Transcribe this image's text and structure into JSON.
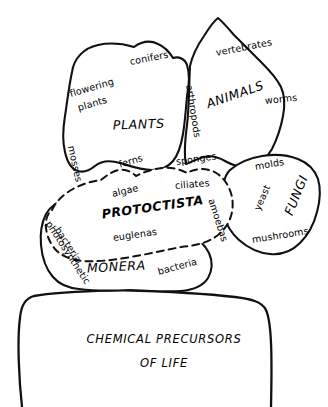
{
  "diagram": {
    "colors": {
      "ink": "#111111",
      "background": "#ffffff"
    },
    "kingdoms": [
      {
        "id": "plants",
        "label": "PLANTS",
        "boundary": "solid",
        "examples": [
          "flowering plants",
          "conifers",
          "mosses",
          "ferns"
        ]
      },
      {
        "id": "animals",
        "label": "ANIMALS",
        "boundary": "solid",
        "examples": [
          "vertebrates",
          "worms",
          "arthropods",
          "sponges"
        ]
      },
      {
        "id": "fungi",
        "label": "FUNGI",
        "boundary": "solid",
        "examples": [
          "molds",
          "yeast",
          "mushrooms"
        ]
      },
      {
        "id": "protoctista",
        "label": "PROTOCTISTA",
        "boundary": "dashed",
        "examples": [
          "algae",
          "ciliates",
          "amoebas",
          "euglenas"
        ]
      },
      {
        "id": "monera",
        "label": "MONERA",
        "boundary": "solid",
        "examples": [
          "photosynthetic bacteria",
          "bacteria"
        ]
      }
    ],
    "base": {
      "id": "chemical-precursors",
      "line1": "CHEMICAL PRECURSORS",
      "line2": "OF LIFE"
    },
    "labels": {
      "plants": "PLANTS",
      "animals": "ANIMALS",
      "fungi": "FUNGI",
      "protoctista": "PROTOCTISTA",
      "monera": "MONERA",
      "flowering_plants_line1": "flowering",
      "flowering_plants_line2": "plants",
      "conifers": "conifers",
      "mosses": "mosses",
      "ferns": "ferns",
      "vertebrates": "vertebrates",
      "worms": "worms",
      "arthropods": "arthropods",
      "sponges": "sponges",
      "molds": "molds",
      "yeast": "yeast",
      "mushrooms": "mushrooms",
      "algae": "algae",
      "ciliates": "ciliates",
      "amoebas": "amoebas",
      "euglenas": "euglenas",
      "photosynthetic": "photosynthetic",
      "bacteria_left": "bacteria",
      "bacteria_right": "bacteria",
      "base_line1": "CHEMICAL PRECURSORS",
      "base_line2": "OF LIFE"
    }
  }
}
